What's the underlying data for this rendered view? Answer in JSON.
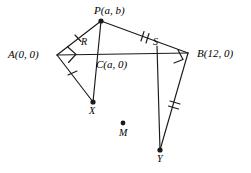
{
  "figure": {
    "type": "geometry-diagram",
    "width": 251,
    "height": 173,
    "background": "#ffffff",
    "stroke_color": "#1a1a1a",
    "labels": {
      "P": "P(a, b)",
      "A": "A(0, 0)",
      "B": "B(12, 0)",
      "C": "C(a, 0)",
      "R": "R",
      "S": "S",
      "X": "X",
      "Y": "Y",
      "M": "M"
    },
    "points": [
      {
        "name": "P",
        "x": 101,
        "y": 21,
        "label": "P(a, b)",
        "dot": true
      },
      {
        "name": "A",
        "x": 57,
        "y": 55,
        "label": "A(0, 0)",
        "dot": false
      },
      {
        "name": "B",
        "x": 188,
        "y": 53,
        "label": "B(12, 0)",
        "dot": false
      },
      {
        "name": "C",
        "x": 101,
        "y": 55,
        "label": "C(a, 0)",
        "dot": false
      },
      {
        "name": "R",
        "x": 85,
        "y": 49,
        "label": "R",
        "dot": false
      },
      {
        "name": "S",
        "x": 157,
        "y": 49,
        "label": "S",
        "dot": false
      },
      {
        "name": "X",
        "x": 93,
        "y": 102,
        "label": "X",
        "dot": true
      },
      {
        "name": "Y",
        "x": 160,
        "y": 150,
        "label": "Y",
        "dot": true
      },
      {
        "name": "M",
        "x": 123,
        "y": 123,
        "label": "M",
        "dot": true
      }
    ],
    "segments": [
      {
        "name": "segment-AP",
        "from": "A",
        "to": "P",
        "ticks": 1
      },
      {
        "name": "segment-PB",
        "from": "P",
        "to": "B",
        "ticks": 2
      },
      {
        "name": "segment-AB",
        "from": "A",
        "to": "B",
        "ticks": 0
      },
      {
        "name": "segment-AX",
        "from": "A",
        "to": "X",
        "ticks": 1
      },
      {
        "name": "segment-CX",
        "from": "C",
        "to": "X",
        "ticks": 0
      },
      {
        "name": "segment-SY",
        "from": "S",
        "to": "Y",
        "ticks": 0
      },
      {
        "name": "segment-BY",
        "from": "B",
        "to": "Y",
        "ticks": 2
      }
    ],
    "right_angles": [
      {
        "name": "right-angle-at-A",
        "vertex": "A"
      },
      {
        "name": "right-angle-at-B",
        "vertex": "B"
      }
    ]
  }
}
